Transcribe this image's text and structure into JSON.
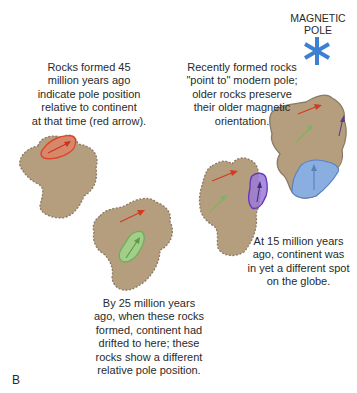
{
  "figure": {
    "panel_label": "B",
    "pole": {
      "title_line1": "MAGNETIC",
      "title_line2": "POLE",
      "icon": "asterisk-star",
      "color": "#3d7fd0"
    },
    "captions": {
      "rocks_45": [
        "Rocks formed 45",
        "million years ago",
        "indicate pole position",
        "relative to continent",
        "at that time (red arrow)."
      ],
      "rocks_recent": [
        "Recently formed rocks",
        "\"point to\" modern pole;",
        "older rocks preserve",
        "their older magnetic",
        "orientation."
      ],
      "rocks_15": [
        "At 15 million years",
        "ago, continent was",
        "in yet a different spot",
        "on the globe."
      ],
      "rocks_25": [
        "By 25 million years",
        "ago, when these rocks",
        "formed, continent had",
        "drifted to here; these",
        "rocks show a different",
        "relative pole position."
      ]
    },
    "colors": {
      "continent_fill": "#b49e7e",
      "continent_outline": "#8a7a66",
      "red_rock": "#e8553a",
      "green_rock": "#8cc67a",
      "purple_rock": "#8a68c8",
      "blue_rock": "#8aaee0",
      "arrow_red": "#d43a22",
      "arrow_green": "#6aa84f",
      "arrow_purple": "#5a3a8a",
      "arrow_blue": "#5a80b8"
    },
    "stages": [
      {
        "age": "45 million years ago",
        "arrows": [
          "red"
        ]
      },
      {
        "age": "25 million years ago",
        "arrows": [
          "red",
          "green"
        ]
      },
      {
        "age": "15 million years ago",
        "arrows": [
          "red",
          "green",
          "purple"
        ]
      },
      {
        "age": "present",
        "arrows": [
          "red",
          "green",
          "purple",
          "blue"
        ]
      }
    ]
  }
}
